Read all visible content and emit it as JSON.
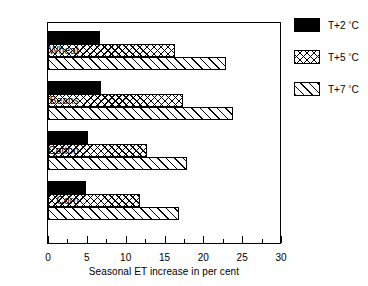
{
  "chart_data": {
    "type": "bar",
    "orientation": "horizontal",
    "title": "",
    "xlabel": "Seasonal ET increase in per cent",
    "ylabel": "",
    "xlim": [
      0,
      30
    ],
    "xticks": [
      0,
      5,
      10,
      15,
      20,
      25,
      30
    ],
    "xtick_labels": [
      "0",
      "5",
      "10",
      "15",
      "20",
      "25",
      "30"
    ],
    "minor_tick_interval": 2.5,
    "grid": false,
    "legend_position": "right",
    "categories": [
      "Wheat",
      "Beans",
      "Cotton",
      "Corn"
    ],
    "series": [
      {
        "name": "T+2 °C",
        "pattern": "solid-black",
        "values": [
          6.7,
          6.8,
          5.1,
          4.9
        ]
      },
      {
        "name": "T+5 °C",
        "pattern": "crosshatch",
        "values": [
          16.4,
          17.4,
          12.7,
          11.9
        ]
      },
      {
        "name": "T+7 °C",
        "pattern": "diagonal-hatch",
        "values": [
          22.9,
          23.8,
          17.9,
          16.9
        ]
      }
    ]
  },
  "legend": {
    "entries": [
      {
        "label_prefix": "T+2 ",
        "degree": "°",
        "unit": "C",
        "pattern": "solid"
      },
      {
        "label_prefix": "T+5 ",
        "degree": "°",
        "unit": "C",
        "pattern": "cross"
      },
      {
        "label_prefix": "T+7 ",
        "degree": "°",
        "unit": "C",
        "pattern": "diag"
      }
    ]
  },
  "axis": {
    "x_title": "Seasonal ET increase in per cent",
    "tick_labels": [
      "0",
      "5",
      "10",
      "15",
      "20",
      "25",
      "30"
    ]
  },
  "colors": {
    "foreground": "#000000",
    "background": "#ffffff"
  }
}
